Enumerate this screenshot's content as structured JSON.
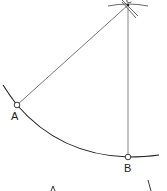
{
  "diagram": {
    "type": "geometric-construction",
    "points": {
      "A": {
        "label": "A",
        "x": 17,
        "y": 105
      },
      "B": {
        "label": "B",
        "x": 128,
        "y": 157
      },
      "C": {
        "label": "C",
        "x": 128,
        "y": 5
      }
    },
    "labels": {
      "a": "A",
      "b": "B",
      "c": "C"
    },
    "colors": {
      "stroke": "#333333",
      "background": "#ffffff"
    }
  }
}
